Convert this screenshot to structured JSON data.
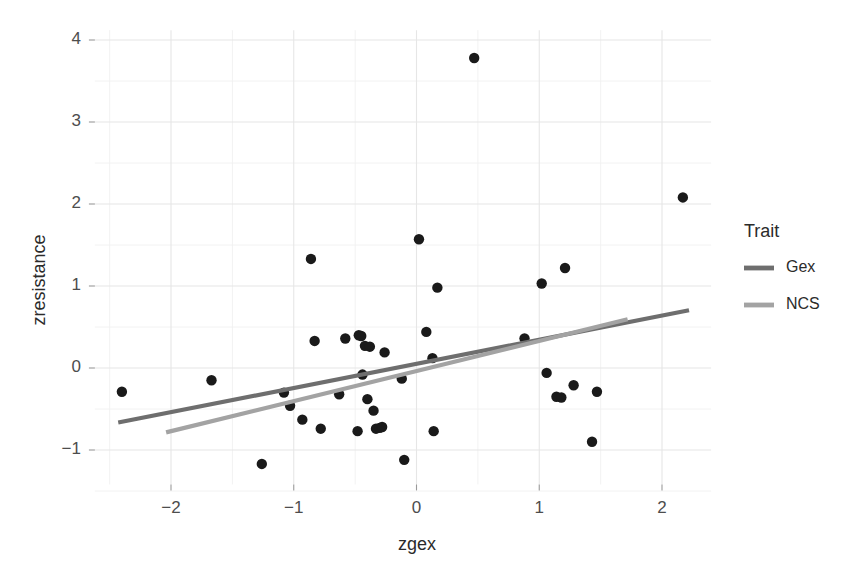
{
  "chart_data": {
    "type": "scatter",
    "title": "",
    "xlabel": "zgex",
    "ylabel": "zresistance",
    "xlim": [
      -2.62,
      2.4
    ],
    "ylim": [
      -1.42,
      4.12
    ],
    "xticks": [
      -2,
      -1,
      0,
      1,
      2
    ],
    "xtick_labels": [
      "−2",
      "−1",
      "0",
      "1",
      "2"
    ],
    "yticks": [
      -1,
      0,
      1,
      2,
      3,
      4
    ],
    "ytick_labels": [
      "−1",
      "0",
      "1",
      "2",
      "3",
      "4"
    ],
    "x_minor_ticks": [
      -2.5,
      -1.5,
      -0.5,
      0.5,
      1.5
    ],
    "y_minor_ticks": [
      -1.5,
      -0.5,
      0.5,
      1.5,
      2.5,
      3.5
    ],
    "grid": true,
    "grid_major_color": "#e6e6e6",
    "grid_minor_color": "#f0f0f0",
    "point_color": "#1a1a1a",
    "point_radius": 5.2,
    "legend_position": "right",
    "legend_title": "Trait",
    "points": [
      {
        "x": -2.4,
        "y": -0.29
      },
      {
        "x": -1.67,
        "y": -0.15
      },
      {
        "x": -1.26,
        "y": -1.17
      },
      {
        "x": -1.08,
        "y": -0.3
      },
      {
        "x": -1.03,
        "y": -0.46
      },
      {
        "x": -0.93,
        "y": -0.63
      },
      {
        "x": -0.86,
        "y": 1.33
      },
      {
        "x": -0.83,
        "y": 0.33
      },
      {
        "x": -0.78,
        "y": -0.74
      },
      {
        "x": -0.63,
        "y": -0.32
      },
      {
        "x": -0.58,
        "y": 0.36
      },
      {
        "x": -0.48,
        "y": -0.77
      },
      {
        "x": -0.47,
        "y": 0.4
      },
      {
        "x": -0.45,
        "y": 0.39
      },
      {
        "x": -0.44,
        "y": -0.08
      },
      {
        "x": -0.42,
        "y": 0.27
      },
      {
        "x": -0.4,
        "y": -0.38
      },
      {
        "x": -0.38,
        "y": 0.26
      },
      {
        "x": -0.35,
        "y": -0.52
      },
      {
        "x": -0.33,
        "y": -0.74
      },
      {
        "x": -0.3,
        "y": -0.73
      },
      {
        "x": -0.28,
        "y": -0.72
      },
      {
        "x": -0.26,
        "y": 0.19
      },
      {
        "x": -0.12,
        "y": -0.13
      },
      {
        "x": -0.1,
        "y": -1.12
      },
      {
        "x": 0.02,
        "y": 1.57
      },
      {
        "x": 0.08,
        "y": 0.44
      },
      {
        "x": 0.13,
        "y": 0.12
      },
      {
        "x": 0.14,
        "y": -0.77
      },
      {
        "x": 0.17,
        "y": 0.98
      },
      {
        "x": 0.47,
        "y": 3.78
      },
      {
        "x": 0.88,
        "y": 0.36
      },
      {
        "x": 1.02,
        "y": 1.03
      },
      {
        "x": 1.06,
        "y": -0.06
      },
      {
        "x": 1.14,
        "y": -0.35
      },
      {
        "x": 1.18,
        "y": -0.36
      },
      {
        "x": 1.21,
        "y": 1.22
      },
      {
        "x": 1.28,
        "y": -0.21
      },
      {
        "x": 1.43,
        "y": -0.9
      },
      {
        "x": 1.47,
        "y": -0.29
      },
      {
        "x": 2.17,
        "y": 2.08
      }
    ],
    "series": [
      {
        "name": "Gex",
        "color": "#6e6e6e",
        "type": "line",
        "x_start": -2.43,
        "y_start": -0.665,
        "x_end": 2.22,
        "y_end": 0.705,
        "width": 4.2
      },
      {
        "name": "NCS",
        "color": "#a3a3a3",
        "type": "line",
        "x_start": -2.04,
        "y_start": -0.785,
        "x_end": 1.72,
        "y_end": 0.595,
        "width": 4.2
      }
    ]
  },
  "legend": {
    "title": "Trait",
    "entries": [
      {
        "label": "Gex",
        "color": "#6e6e6e"
      },
      {
        "label": "NCS",
        "color": "#a3a3a3"
      }
    ]
  },
  "axes": {
    "x_title": "zgex",
    "y_title": "zresistance"
  }
}
